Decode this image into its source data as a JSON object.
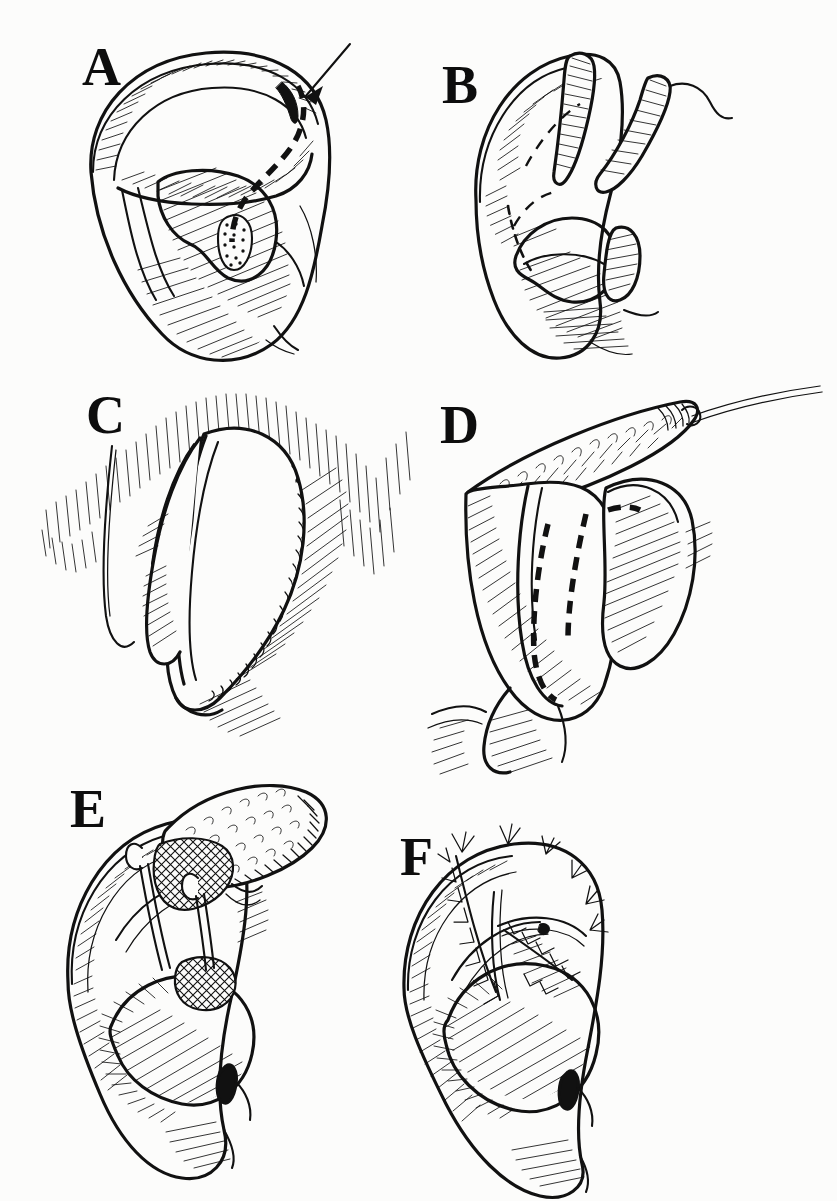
{
  "figure": {
    "medium": "pen-and-ink line drawing",
    "background_color": "#fcfcfb",
    "ink_color": "#111111",
    "panel_count": 6,
    "layout": "2 columns x 3 rows"
  },
  "panels": [
    {
      "letter": "A",
      "name": "panel-a",
      "row": 1,
      "column": 1,
      "subject": "auricle with superior helical rim lesion",
      "view": "lateral right ear",
      "annotations": [
        "arrow indicating lesion at helical rim",
        "heavy dashed excision outline along scapha and antihelix",
        "stippled lesion in concha"
      ],
      "markers": {
        "arrow": "down-left arrow at superior helix"
      }
    },
    {
      "letter": "B",
      "name": "panel-b",
      "row": 1,
      "column": 2,
      "subject": "auricle after full-thickness excision, wound edges retracted",
      "view": "lateral right ear",
      "annotations": [
        "two cut cartilage ends shown in cross-section hatching",
        "light dashed line marking original helix contour",
        "defect gaping open"
      ],
      "markers": {
        "arrow": ""
      }
    },
    {
      "letter": "C",
      "name": "panel-c",
      "row": 2,
      "column": 1,
      "subject": "retroauricular sulcus with ear reflected forward",
      "view": "posterior / postauricular",
      "annotations": [
        "hatched mastoid scalp skin",
        "planned flap outline drawn in sulcus",
        "shadow hatching beneath auricle"
      ],
      "markers": {
        "arrow": ""
      }
    },
    {
      "letter": "D",
      "name": "panel-d",
      "row": 2,
      "column": 2,
      "subject": "postauricular flap elevated on traction suture",
      "view": "posterior / postauricular",
      "annotations": [
        "flap raised showing stippled undersurface",
        "traction suture extending superiorly",
        "heavy dashed lines outlining cartilage graft to be taken"
      ],
      "markers": {
        "suture": "traction suture at flap tip"
      }
    },
    {
      "letter": "E",
      "name": "panel-e",
      "row": 3,
      "column": 1,
      "subject": "flap transposed into helical defect with composite cartilage graft",
      "view": "lateral right ear",
      "annotations": [
        "stippled hair-bearing flap surface",
        "cross-hatched cartilage graft inset",
        "two skin hooks retracting wound edges",
        "hatched conchal bowl"
      ],
      "markers": {
        "hooks": "two skin hooks"
      }
    },
    {
      "letter": "F",
      "name": "panel-f",
      "row": 3,
      "column": 2,
      "subject": "completed repair with interrupted sutures",
      "view": "lateral right ear",
      "annotations": [
        "interrupted sutures along the helical rim and scapha",
        "hatched concha",
        "restored helical contour"
      ],
      "markers": {
        "sutures": "interrupted suture knots"
      }
    }
  ]
}
